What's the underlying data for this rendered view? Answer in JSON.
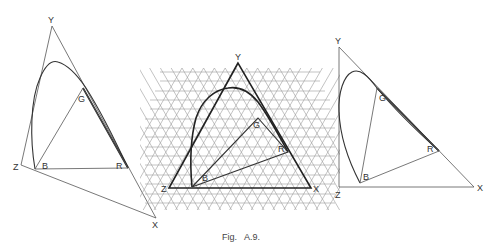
{
  "figure": {
    "caption": "Fig.   A.9.",
    "colors": {
      "line": "#333333",
      "grid": "#9a9a9a",
      "background": "#ffffff"
    }
  },
  "diagrams": [
    {
      "id": "left",
      "description": "Oblique triangle XYZ containing spectral locus and RGB triangle",
      "labels": {
        "Y": "Y",
        "Z": "Z",
        "X": "X",
        "B": "B",
        "R": "R",
        "G": "G"
      },
      "points": {
        "Y": [
          52,
          26
        ],
        "Z": [
          21,
          165
        ],
        "X": [
          156,
          218
        ],
        "B": [
          35,
          169
        ],
        "R": [
          128,
          168
        ],
        "G": [
          83,
          88
        ]
      }
    },
    {
      "id": "middle",
      "description": "Equilateral triangle XYZ over triangular grid with spectral locus and RGB triangle",
      "labels": {
        "Y": "Y",
        "Z": "Z",
        "X": "X",
        "B": "B",
        "R": "R",
        "G": "G"
      },
      "points": {
        "Y": [
          238,
          63
        ],
        "Z": [
          169,
          188
        ],
        "X": [
          311,
          188
        ],
        "B": [
          192,
          187
        ],
        "R": [
          288,
          152
        ],
        "G": [
          258,
          118
        ]
      }
    },
    {
      "id": "right",
      "description": "Right-angle triangle XYZ with spectral locus and RGB triangle",
      "labels": {
        "Y": "Y",
        "Z": "Z",
        "X": "X",
        "B": "B",
        "R": "R",
        "G": "G"
      },
      "points": {
        "Y": [
          339,
          47
        ],
        "Z": [
          339,
          187
        ],
        "X": [
          474,
          187
        ],
        "B": [
          360,
          183
        ],
        "R": [
          439,
          151
        ],
        "G": [
          377,
          88
        ]
      }
    }
  ]
}
